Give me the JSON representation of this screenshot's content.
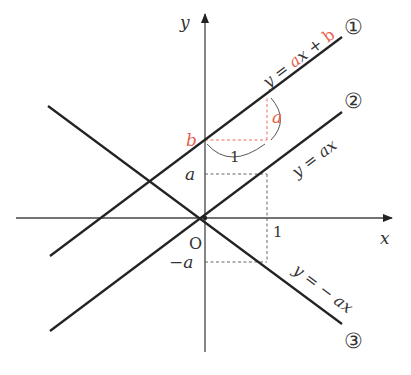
{
  "figure": {
    "axes": {
      "x_label": "x",
      "y_label": "y",
      "origin_label": "O",
      "x_tick_label": "1",
      "y_tick_a": "a",
      "y_tick_neg_a": "−a",
      "y_tick_b": "b"
    },
    "lines": [
      {
        "id": "1",
        "marker": "①",
        "equation_parts": [
          "y = ",
          "a",
          "x + ",
          "b"
        ],
        "slope": "a",
        "intercept": "b"
      },
      {
        "id": "2",
        "marker": "②",
        "equation": "y = ax",
        "slope": "a",
        "intercept": "0"
      },
      {
        "id": "3",
        "marker": "③",
        "equation": "y = − ax",
        "slope": "−a",
        "intercept": "0"
      }
    ],
    "slope_triangle": {
      "run_label": "1",
      "rise_label": "a"
    },
    "colors": {
      "ink": "#222222",
      "accent": "#e8604c",
      "guide": "#555555"
    }
  }
}
